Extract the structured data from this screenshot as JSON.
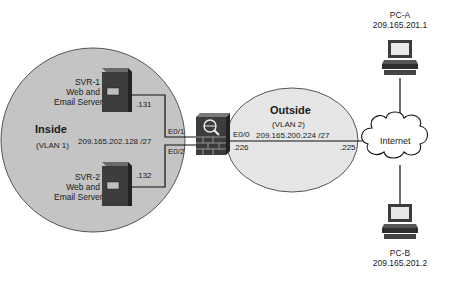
{
  "zones": {
    "inside": {
      "title": "Inside",
      "vlan": "(VLAN 1)",
      "subnet": "209.165.202.128 /27",
      "fill": "#c4c4c4"
    },
    "outside": {
      "title": "Outside",
      "vlan": "(VLAN 2)",
      "subnet": "209.165.200.224 /27",
      "fill": "#e6e6e6"
    }
  },
  "servers": [
    {
      "name": "SVR-1",
      "role_line1": "Web and",
      "role_line2": "Email Server",
      "host": ".131",
      "interface": "E0/1"
    },
    {
      "name": "SVR-2",
      "role_line1": "Web and",
      "role_line2": "Email Server",
      "host": ".132",
      "interface": "E0/2"
    }
  ],
  "firewall": {
    "outside_interface": "E0/0",
    "outside_host": ".226",
    "icon": "firewall-icon"
  },
  "router_outside_host": ".225",
  "cloud": {
    "label": "Internet"
  },
  "pcs": [
    {
      "name": "PC-A",
      "ip": "209.165.201.1"
    },
    {
      "name": "PC-B",
      "ip": "209.165.201.2"
    }
  ]
}
